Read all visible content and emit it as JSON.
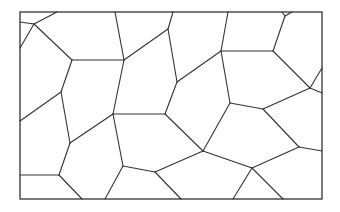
{
  "diagram": {
    "type": "voronoi-tessellation",
    "stroke_color": "#333333",
    "background": "#ffffff",
    "frame": {
      "x": 20,
      "y": 12,
      "width": 302,
      "height": 187
    },
    "edges": [
      [
        20,
        22,
        34,
        24
      ],
      [
        34,
        24,
        57,
        12
      ],
      [
        34,
        24,
        20,
        48
      ],
      [
        34,
        24,
        72,
        60
      ],
      [
        72,
        60,
        124,
        60
      ],
      [
        115,
        12,
        124,
        60
      ],
      [
        124,
        60,
        168,
        29
      ],
      [
        168,
        29,
        173,
        12
      ],
      [
        168,
        29,
        177,
        82
      ],
      [
        177,
        82,
        221,
        51
      ],
      [
        221,
        51,
        228,
        12
      ],
      [
        221,
        51,
        273,
        51
      ],
      [
        273,
        51,
        285,
        16
      ],
      [
        285,
        16,
        282,
        12
      ],
      [
        285,
        16,
        292,
        12
      ],
      [
        273,
        51,
        310,
        88
      ],
      [
        310,
        88,
        322,
        68
      ],
      [
        310,
        88,
        322,
        93
      ],
      [
        72,
        60,
        61,
        92
      ],
      [
        61,
        92,
        20,
        121
      ],
      [
        61,
        92,
        70,
        143
      ],
      [
        124,
        60,
        113,
        114
      ],
      [
        177,
        82,
        165,
        114
      ],
      [
        113,
        114,
        165,
        114
      ],
      [
        221,
        51,
        230,
        103
      ],
      [
        230,
        103,
        263,
        109
      ],
      [
        263,
        109,
        310,
        88
      ],
      [
        263,
        109,
        299,
        147
      ],
      [
        299,
        147,
        322,
        151
      ],
      [
        165,
        114,
        203,
        151
      ],
      [
        203,
        151,
        230,
        103
      ],
      [
        203,
        151,
        252,
        168
      ],
      [
        252,
        168,
        299,
        147
      ],
      [
        252,
        168,
        233,
        199
      ],
      [
        252,
        168,
        283,
        199
      ],
      [
        203,
        151,
        155,
        172
      ],
      [
        155,
        172,
        181,
        199
      ],
      [
        155,
        172,
        123,
        166
      ],
      [
        113,
        114,
        70,
        143
      ],
      [
        113,
        114,
        123,
        166
      ],
      [
        123,
        166,
        105,
        199
      ],
      [
        70,
        143,
        59,
        175
      ],
      [
        59,
        175,
        20,
        175
      ],
      [
        59,
        175,
        82,
        199
      ]
    ]
  }
}
